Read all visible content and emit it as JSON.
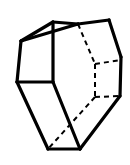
{
  "figure": {
    "name": "hexagonal-prism",
    "canvas": {
      "width": 130,
      "height": 165,
      "background": "#ffffff"
    },
    "style": {
      "stroke_color": "#000000",
      "fill_color": "#ffffff",
      "solid_stroke_width": 3.2,
      "dashed_stroke_width": 2.0,
      "dash_pattern": "5,4"
    },
    "vertices": {
      "front_top_left": [
        21,
        41
      ],
      "front_top_apex": [
        53,
        22
      ],
      "front_bottom_left": [
        17,
        82
      ],
      "front_mid_right": [
        53,
        82
      ],
      "front_bottom_apex": [
        48,
        149
      ],
      "back_top_left": [
        78,
        24
      ],
      "back_top_right": [
        109,
        20
      ],
      "right_upper": [
        121,
        57
      ],
      "right_lower": [
        120,
        96
      ],
      "bottom_right": [
        80,
        149
      ],
      "hidden_center_top": [
        95,
        64
      ],
      "hidden_center_bottom": [
        95,
        97
      ]
    },
    "solid_edges": [
      {
        "name": "left-face-top-edge",
        "points": "21,41 53,22"
      },
      {
        "name": "left-face-left-edge",
        "points": "21,41 17,82"
      },
      {
        "name": "left-face-bottom-edge",
        "points": "17,82 53,82"
      },
      {
        "name": "left-face-right-edge",
        "points": "53,22 53,82"
      },
      {
        "name": "top-face-back-left-edge",
        "points": "53,22 78,24"
      },
      {
        "name": "top-face-ridge-edge",
        "points": "78,24 109,20"
      },
      {
        "name": "top-right-slant-edge",
        "points": "109,20 121,57"
      },
      {
        "name": "right-vertical-edge",
        "points": "121,57 120,96"
      },
      {
        "name": "bottom-right-slant-edge",
        "points": "120,96 80,149"
      },
      {
        "name": "bottom-edge",
        "points": "80,149 48,149"
      },
      {
        "name": "front-lower-left-edge",
        "points": "48,149 17,82"
      },
      {
        "name": "front-lower-right-edge",
        "points": "53,82 80,149"
      },
      {
        "name": "top-front-left-slant",
        "points": "21,41 78,24"
      }
    ],
    "dashed_edges": [
      {
        "name": "hidden-vertical-upper-edge",
        "points": "78,24 95,64"
      },
      {
        "name": "hidden-back-top-edge",
        "points": "95,64 121,60"
      },
      {
        "name": "hidden-back-vertical-edge",
        "points": "95,64 95,97"
      },
      {
        "name": "hidden-back-bottom-edge",
        "points": "95,97 120,96"
      },
      {
        "name": "hidden-lower-diagonal-edge",
        "points": "95,97 48,149"
      }
    ]
  }
}
